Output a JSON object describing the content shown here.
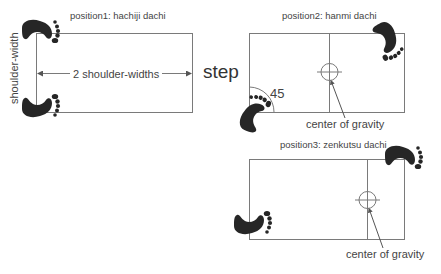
{
  "diagram": {
    "step_label": "step",
    "positions": [
      {
        "label": "position1: hachiji dachi",
        "width_label": "2 shoulder-widths",
        "height_label": "shoulder-width"
      },
      {
        "label": "position2: hanmi dachi",
        "angle_label": "45",
        "cog_label": "center of gravity"
      },
      {
        "label": "position3: zenkutsu dachi",
        "cog_label": "center of gravity"
      }
    ]
  },
  "colors": {
    "line": "#7a7a7a",
    "foot": "#262626",
    "text": "#444444",
    "background": "#ffffff"
  }
}
